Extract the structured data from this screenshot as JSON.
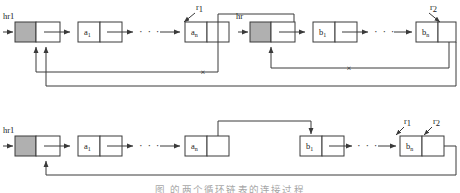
{
  "figure": {
    "caption": "图         的两个循环链表的连接过程",
    "stroke_color": "#3a3a3a",
    "fill_shaded": "#b0b0b0",
    "fill_empty": "#ffffff"
  },
  "panels": [
    {
      "id": "before",
      "name": "before-merge",
      "lists": [
        {
          "id": "list-a",
          "head_label": "hr1",
          "head_node": {
            "shaded": true
          },
          "nodes": [
            {
              "label": "a",
              "sub": "1"
            },
            {
              "label": "a",
              "sub": "n"
            }
          ],
          "ellipsis": "· · ·",
          "pointer_labels": [
            {
              "name": "r1",
              "label": "r",
              "sub": "1"
            }
          ],
          "cut_marks": 1
        },
        {
          "id": "list-b",
          "head_label": "hr",
          "head_node": {
            "shaded": true
          },
          "nodes": [
            {
              "label": "b",
              "sub": "1"
            },
            {
              "label": "b",
              "sub": "n"
            }
          ],
          "ellipsis": "· · ·",
          "pointer_labels": [
            {
              "name": "r2",
              "label": "r",
              "sub": "2"
            }
          ],
          "cut_marks": 1
        }
      ]
    },
    {
      "id": "after",
      "name": "after-merge",
      "lists": [
        {
          "id": "list-merged",
          "head_label": "hr1",
          "head_node": {
            "shaded": true
          },
          "nodes": [
            {
              "label": "a",
              "sub": "1"
            },
            {
              "label": "a",
              "sub": "n"
            },
            {
              "label": "b",
              "sub": "1"
            },
            {
              "label": "b",
              "sub": "n"
            }
          ],
          "ellipsis": "· · ·",
          "pointer_labels": [
            {
              "name": "r1",
              "label": "r",
              "sub": "1"
            },
            {
              "name": "r2",
              "label": "r",
              "sub": "2"
            }
          ],
          "cut_marks": 0
        }
      ]
    }
  ],
  "glyphs": {
    "cut_mark": "×",
    "ellipsis": "· · ·"
  }
}
